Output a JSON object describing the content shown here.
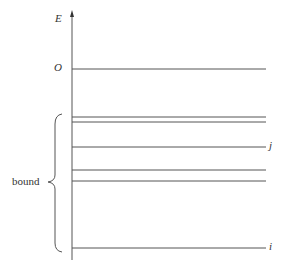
{
  "diagram": {
    "axis_label": "E",
    "zero_label": "O",
    "group_label": "bound",
    "level_labels": {
      "upper": "j",
      "lower": "i"
    },
    "levels_y": [
      69,
      117,
      122,
      147,
      170,
      181,
      248
    ],
    "colors": {
      "line": "#555555",
      "text": "#333333"
    }
  }
}
